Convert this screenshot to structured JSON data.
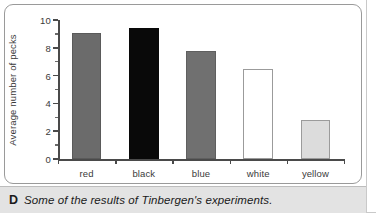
{
  "figure": {
    "caption_letter": "D",
    "caption_text": "Some of the results of Tinbergen's experiments."
  },
  "chart_data": {
    "type": "bar",
    "title": "",
    "xlabel": "Colour of spot on beak",
    "ylabel": "Average number of pecks",
    "categories": [
      "red",
      "black",
      "blue",
      "white",
      "yellow"
    ],
    "values": [
      9.1,
      9.4,
      7.8,
      6.5,
      2.8
    ],
    "ylim": [
      0,
      10
    ],
    "ytick_labels": [
      "0",
      "2",
      "4",
      "6",
      "8",
      "10"
    ],
    "ytick_values": [
      0,
      2,
      4,
      6,
      8,
      10
    ],
    "yminor_values": [
      1,
      3,
      5,
      7,
      9
    ],
    "grid": false,
    "legend": "none",
    "bar_styles": [
      {
        "category": "red",
        "fill": "#6b6b6b",
        "border": "#5a5a5a"
      },
      {
        "category": "black",
        "fill": "#090909",
        "border": "#090909"
      },
      {
        "category": "blue",
        "fill": "#707070",
        "border": "#5f5f5f"
      },
      {
        "category": "white",
        "fill": "#ffffff",
        "border": "#9b9b9b"
      },
      {
        "category": "yellow",
        "fill": "#dcdcdc",
        "border": "#9b9b9b"
      }
    ],
    "axis_color": "#4a4a4a"
  }
}
